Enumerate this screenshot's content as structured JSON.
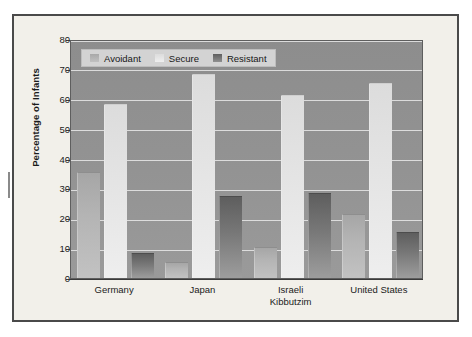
{
  "figure": {
    "y_axis_title": "Percentage of Infants"
  },
  "legend": {
    "items": [
      {
        "label": "Avoidant",
        "key": "avoidant",
        "color": "#b4b4b4"
      },
      {
        "label": "Secure",
        "key": "secure",
        "color": "#e4e4e4"
      },
      {
        "label": "Resistant",
        "key": "resistant",
        "color": "#787878"
      }
    ]
  },
  "y_axis": {
    "ticks": [
      "80",
      "70",
      "60",
      "50",
      "40",
      "30",
      "20",
      "10",
      "0"
    ]
  },
  "x_axis": {
    "labels": [
      {
        "line1": "Germany",
        "line2": ""
      },
      {
        "line1": "Japan",
        "line2": ""
      },
      {
        "line1": "Israeli",
        "line2": "Kibbutzim"
      },
      {
        "line1": "United States",
        "line2": ""
      }
    ]
  },
  "chart_data": {
    "type": "bar",
    "title": "",
    "xlabel": "",
    "ylabel": "Percentage of Infants",
    "ylim": [
      0,
      80
    ],
    "ytick_step": 10,
    "grid": true,
    "legend_position": "top-left-inside",
    "categories": [
      "Germany",
      "Japan",
      "Israeli Kibbutzim",
      "United States"
    ],
    "series": [
      {
        "name": "Avoidant",
        "values": [
          35,
          5,
          10,
          21
        ]
      },
      {
        "name": "Secure",
        "values": [
          58,
          68,
          61,
          65
        ]
      },
      {
        "name": "Resistant",
        "values": [
          8,
          27,
          28,
          15
        ]
      }
    ]
  }
}
